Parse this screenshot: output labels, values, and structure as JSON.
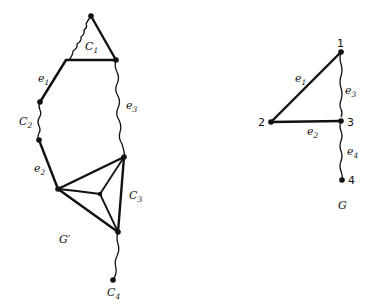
{
  "graphs": [
    {
      "name": "G'",
      "label": "G",
      "label_sup": "′",
      "cycles": [
        "C1",
        "C2",
        "C3",
        "C4"
      ],
      "edge_labels": [
        {
          "base": "e",
          "sub": "1"
        },
        {
          "base": "e",
          "sub": "2"
        },
        {
          "base": "e",
          "sub": "3"
        }
      ],
      "cycle_labels": [
        {
          "base": "C",
          "sub": "1"
        },
        {
          "base": "C",
          "sub": "2"
        },
        {
          "base": "C",
          "sub": "3"
        },
        {
          "base": "C",
          "sub": "4"
        }
      ]
    },
    {
      "name": "G",
      "label": "G",
      "vertices": [
        "1",
        "2",
        "3",
        "4"
      ],
      "edge_labels": [
        {
          "base": "e",
          "sub": "1"
        },
        {
          "base": "e",
          "sub": "2"
        },
        {
          "base": "e",
          "sub": "3"
        },
        {
          "base": "e",
          "sub": "4"
        }
      ]
    }
  ]
}
